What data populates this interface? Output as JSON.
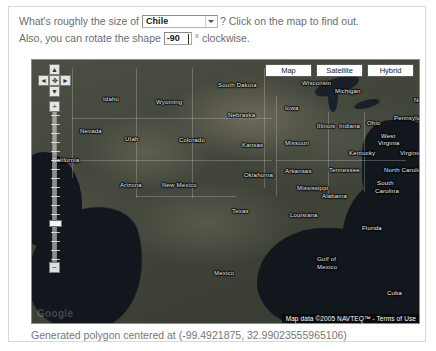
{
  "prompt": {
    "line1_before": "What's roughly the size of",
    "selected_country": "Chile",
    "line1_after": "? Click on the map to find out.",
    "line2_before": "Also, you can rotate the shape",
    "rotation_value": "-90",
    "line2_after": "° clockwise."
  },
  "map": {
    "types": [
      {
        "label": "Map"
      },
      {
        "label": "Satellite"
      },
      {
        "label": "Hybrid"
      }
    ],
    "active_type": "Satellite",
    "pan": {
      "up": "▲",
      "left": "◄",
      "home": "✥",
      "right": "►",
      "down": "▼"
    },
    "zoom": {
      "in_label": "+",
      "out_label": "−",
      "tick_count": 17,
      "handle_position_index": 12
    },
    "attribution": "Map data ©2005 NAVTEQ™ - Terms of Use",
    "watermark": "Google",
    "labels": [
      {
        "name": "Idaho",
        "x": 71,
        "y": 36
      },
      {
        "name": "Wyoming",
        "x": 124,
        "y": 39
      },
      {
        "name": "South Dakota",
        "x": 186,
        "y": 22
      },
      {
        "name": "Nebraska",
        "x": 196,
        "y": 52
      },
      {
        "name": "Nevada",
        "x": 48,
        "y": 68
      },
      {
        "name": "Utah",
        "x": 93,
        "y": 76
      },
      {
        "name": "Colorado",
        "x": 147,
        "y": 77
      },
      {
        "name": "Kansas",
        "x": 210,
        "y": 82
      },
      {
        "name": "California",
        "x": 20,
        "y": 97
      },
      {
        "name": "Oklahoma",
        "x": 212,
        "y": 112
      },
      {
        "name": "Arizona",
        "x": 88,
        "y": 122
      },
      {
        "name": "New Mexico",
        "x": 130,
        "y": 122
      },
      {
        "name": "Texas",
        "x": 200,
        "y": 148
      },
      {
        "name": "Mexico",
        "x": 182,
        "y": 210
      },
      {
        "name": "Wisconsin",
        "x": 270,
        "y": 20
      },
      {
        "name": "Michigan",
        "x": 303,
        "y": 28
      },
      {
        "name": "Iowa",
        "x": 253,
        "y": 45
      },
      {
        "name": "Illinois",
        "x": 285,
        "y": 63
      },
      {
        "name": "Indiana",
        "x": 307,
        "y": 63
      },
      {
        "name": "Ohio",
        "x": 335,
        "y": 60
      },
      {
        "name": "New York",
        "x": 382,
        "y": 37
      },
      {
        "name": "Pennsylvania",
        "x": 362,
        "y": 55
      },
      {
        "name": "Missouri",
        "x": 253,
        "y": 80
      },
      {
        "name": "Kentucky",
        "x": 317,
        "y": 90
      },
      {
        "name": "West",
        "x": 349,
        "y": 73
      },
      {
        "name": "Virginia",
        "x": 346,
        "y": 80
      },
      {
        "name": "Virginia",
        "x": 368,
        "y": 90
      },
      {
        "name": "Arkansas",
        "x": 253,
        "y": 108
      },
      {
        "name": "Tennessee",
        "x": 297,
        "y": 107
      },
      {
        "name": "North Carolina",
        "x": 352,
        "y": 107
      },
      {
        "name": "Mississippi",
        "x": 265,
        "y": 125
      },
      {
        "name": "Alabama",
        "x": 290,
        "y": 133
      },
      {
        "name": "South",
        "x": 345,
        "y": 120
      },
      {
        "name": "Carolina",
        "x": 343,
        "y": 128
      },
      {
        "name": "District",
        "x": 390,
        "y": 122
      },
      {
        "name": "Columbia",
        "x": 388,
        "y": 131
      },
      {
        "name": "Louisiana",
        "x": 258,
        "y": 152
      },
      {
        "name": "Florida",
        "x": 330,
        "y": 165
      },
      {
        "name": "Cuba",
        "x": 355,
        "y": 230
      }
    ],
    "water_labels": [
      {
        "name": "Gulf of",
        "x": 285,
        "y": 196
      },
      {
        "name": "Mexico",
        "x": 285,
        "y": 204
      }
    ]
  },
  "status": {
    "text": "Generated polygon centered at (-99.4921875, 32.99023555965106)"
  }
}
